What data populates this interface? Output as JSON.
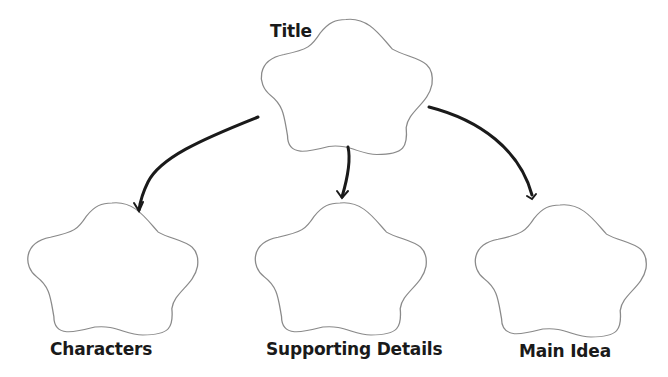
{
  "diagram": {
    "type": "graphic-organizer",
    "background": "#ffffff",
    "cloud_stroke": "#8a8a8a",
    "arrow_color": "#1a1a1a",
    "title_node": {
      "label": "Title"
    },
    "child_nodes": [
      {
        "label": "Characters"
      },
      {
        "label": "Supporting Details"
      },
      {
        "label": "Main Idea"
      }
    ],
    "edges": [
      {
        "from": "Title",
        "to": "Characters"
      },
      {
        "from": "Title",
        "to": "Supporting Details"
      },
      {
        "from": "Title",
        "to": "Main Idea"
      }
    ]
  }
}
